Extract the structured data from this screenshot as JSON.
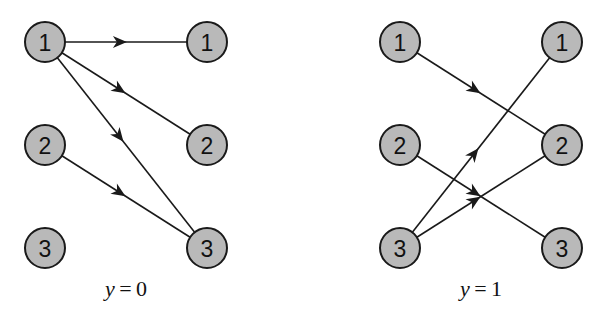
{
  "panels": [
    {
      "caption_var": "y",
      "caption_eq": " = ",
      "caption_val": "0",
      "caption_cx": 126,
      "left_x": 45,
      "right_x": 207,
      "left_nodes": [
        "1",
        "2",
        "3"
      ],
      "right_nodes": [
        "1",
        "2",
        "3"
      ],
      "edges": [
        {
          "from": 1,
          "to": 1
        },
        {
          "from": 1,
          "to": 2
        },
        {
          "from": 1,
          "to": 3
        },
        {
          "from": 2,
          "to": 3
        }
      ]
    },
    {
      "caption_var": "y",
      "caption_eq": " = ",
      "caption_val": "1",
      "caption_cx": 481,
      "left_x": 400,
      "right_x": 562,
      "left_nodes": [
        "1",
        "2",
        "3"
      ],
      "right_nodes": [
        "1",
        "2",
        "3"
      ],
      "edges": [
        {
          "from": 1,
          "to": 2
        },
        {
          "from": 2,
          "to": 3
        },
        {
          "from": 3,
          "to": 1
        },
        {
          "from": 3,
          "to": 2
        }
      ]
    }
  ],
  "layout": {
    "row_y": [
      42,
      145,
      248
    ],
    "node_radius": 20,
    "caption_y": 296
  },
  "colors": {
    "node_fill": "#b9b9b9",
    "stroke": "#1a1a1a",
    "background": "#ffffff"
  }
}
